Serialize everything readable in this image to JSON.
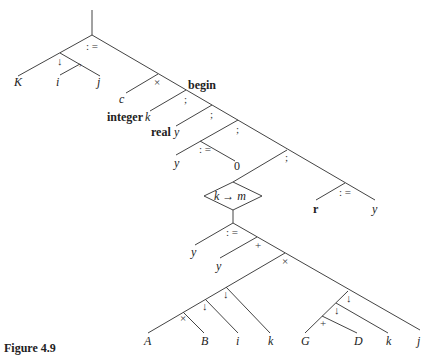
{
  "figure": {
    "caption": "Figure 4.9",
    "type": "abstract syntax tree"
  },
  "nodes": {
    "root_assign": ": =",
    "index_op": "↓",
    "comma": ",",
    "K": "K",
    "i1": "i",
    "j1": "j",
    "times1": "×",
    "c": "c",
    "begin": "begin",
    "semi1": ";",
    "integer_kw": "integer",
    "k1": "k",
    "semi2": ";",
    "real_kw": "real",
    "y1": "y",
    "semi3": ";",
    "assign2": ": =",
    "y2": "y",
    "zero": "0",
    "semi4": ";",
    "loop": "k → m",
    "assign3": ": =",
    "y3": "y",
    "plus1": "+",
    "y4": "y",
    "times2": "×",
    "idx2": "↓",
    "idx3": "↓",
    "times3": "×",
    "A": "A",
    "B": "B",
    "i2": "i",
    "k2": "k",
    "idx4": "↓",
    "idx5": "↓",
    "plus2": "+",
    "G": "G",
    "D": "D",
    "k3": "k",
    "j2": "j",
    "assign4": ": =",
    "r": "r",
    "y5": "y"
  }
}
